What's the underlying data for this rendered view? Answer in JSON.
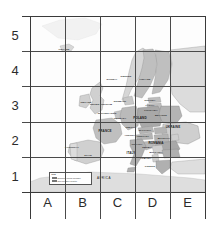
{
  "figure": {
    "grid_columns": [
      "A",
      "B",
      "C",
      "D",
      "E"
    ],
    "grid_rows": [
      "5",
      "4",
      "3",
      "2",
      "1"
    ]
  },
  "colors": {
    "land": "#d2d2d2",
    "land_light": "#e6e6e6",
    "highlight": "#b4b4b4",
    "water": "#fdfdfd",
    "gridline": "#4a4a4a",
    "label": "#1a1a1a"
  },
  "legend": {
    "title": "Key",
    "entries": [
      {
        "label": "European Union member",
        "color": "#b4b4b4"
      },
      {
        "label": "Non-member country",
        "color": "#e2e2e2"
      }
    ]
  },
  "continent_labels": [
    {
      "name": "AFRICA",
      "x": 104,
      "y": 178
    }
  ],
  "countries": [
    {
      "name": "ICELAND",
      "x": 64,
      "y": 49,
      "size": "small"
    },
    {
      "name": "NORWAY",
      "x": 112,
      "y": 79,
      "size": "small"
    },
    {
      "name": "SWEDEN",
      "x": 126,
      "y": 76,
      "size": "small"
    },
    {
      "name": "FINLAND",
      "x": 145,
      "y": 79,
      "size": "small"
    },
    {
      "name": "RUSSIA",
      "x": 180,
      "y": 86,
      "size": "small"
    },
    {
      "name": "ESTONIA",
      "x": 150,
      "y": 100,
      "size": "small"
    },
    {
      "name": "LATVIA",
      "x": 150,
      "y": 105,
      "size": "small"
    },
    {
      "name": "DENMARK",
      "x": 120,
      "y": 101,
      "size": "small"
    },
    {
      "name": "IRELAND",
      "x": 86,
      "y": 102,
      "size": "small"
    },
    {
      "name": "UNITED KINGDOM",
      "x": 101,
      "y": 104,
      "size": "small"
    },
    {
      "name": "LITHUANIA",
      "x": 151,
      "y": 110,
      "size": "small"
    },
    {
      "name": "NETHERLANDS",
      "x": 107,
      "y": 113,
      "size": "small"
    },
    {
      "name": "BELARUS",
      "x": 161,
      "y": 115,
      "size": "small"
    },
    {
      "name": "GERMANY",
      "x": 120,
      "y": 118,
      "size": "small"
    },
    {
      "name": "POLAND",
      "x": 140,
      "y": 118,
      "size": "mid"
    },
    {
      "name": "UKRAINE",
      "x": 173,
      "y": 127,
      "size": "mid"
    },
    {
      "name": "CZECHIA",
      "x": 131,
      "y": 127,
      "size": "small"
    },
    {
      "name": "SLOVAKIA",
      "x": 145,
      "y": 130,
      "size": "small"
    },
    {
      "name": "FRANCE",
      "x": 105,
      "y": 131,
      "size": "mid"
    },
    {
      "name": "AUSTRIA",
      "x": 130,
      "y": 135,
      "size": "small"
    },
    {
      "name": "HUNGARY",
      "x": 143,
      "y": 136,
      "size": "small"
    },
    {
      "name": "MOLDOVA",
      "x": 164,
      "y": 138,
      "size": "small"
    },
    {
      "name": "ROMANIA",
      "x": 156,
      "y": 143,
      "size": "mid"
    },
    {
      "name": "PORTUGAL",
      "x": 72,
      "y": 147,
      "size": "small"
    },
    {
      "name": "CROATIA",
      "x": 137,
      "y": 144,
      "size": "small"
    },
    {
      "name": "SERBIA",
      "x": 147,
      "y": 147,
      "size": "small"
    },
    {
      "name": "BULGARIA",
      "x": 156,
      "y": 152,
      "size": "small"
    },
    {
      "name": "ITALY",
      "x": 131,
      "y": 153,
      "size": "mid"
    },
    {
      "name": "SPAIN",
      "x": 88,
      "y": 155,
      "size": "small"
    },
    {
      "name": "ALBANIA",
      "x": 146,
      "y": 158,
      "size": "small"
    },
    {
      "name": "GREECE",
      "x": 150,
      "y": 166,
      "size": "small"
    }
  ]
}
